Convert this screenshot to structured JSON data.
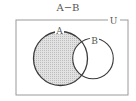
{
  "title": "A−B",
  "universe_label": "U",
  "sets": [
    {
      "label": "A",
      "shaded": true
    },
    {
      "label": "B",
      "shaded": false
    }
  ],
  "colors": {
    "outline": "#3a3a3a",
    "frame": "#9a9a9a",
    "shade": "#d0d0d0",
    "text": "#555555"
  }
}
